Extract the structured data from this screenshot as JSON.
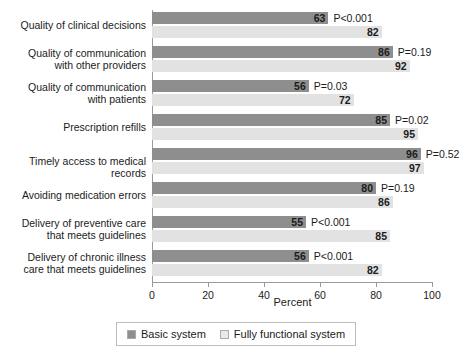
{
  "chart_data": {
    "type": "bar",
    "orientation": "horizontal",
    "title": "",
    "xlabel": "Percent",
    "ylabel": "",
    "xlim": [
      0,
      100
    ],
    "xticks": [
      0,
      20,
      40,
      60,
      80,
      100
    ],
    "grid": false,
    "legend_position": "bottom-center",
    "categories": [
      "Quality of clinical decisions",
      "Quality of communication\nwith other providers",
      "Quality of communication\nwith patients",
      "Prescription refills",
      "Timely access to medical records",
      "Avoiding medication errors",
      "Delivery of preventive care\nthat meets guidelines",
      "Delivery of chronic illness\ncare that meets guidelines"
    ],
    "series": [
      {
        "name": "Basic system",
        "color": "#8e8e8e",
        "values": [
          63,
          86,
          56,
          85,
          96,
          80,
          55,
          56
        ]
      },
      {
        "name": "Fully functional system",
        "color": "#e2e2e2",
        "values": [
          82,
          92,
          72,
          95,
          97,
          86,
          85,
          82
        ]
      }
    ],
    "annotations": {
      "label": "p-value",
      "values": [
        "P<0.001",
        "P=0.19",
        "P=0.03",
        "P=0.02",
        "P=0.52",
        "P=0.19",
        "P<0.001",
        "P<0.001"
      ]
    }
  },
  "axis": {
    "xlabel": "Percent",
    "ticklabels": [
      "0",
      "20",
      "40",
      "60",
      "80",
      "100"
    ]
  },
  "legend": {
    "items": [
      {
        "label": "Basic system",
        "swatch": "dark"
      },
      {
        "label": "Fully functional system",
        "swatch": "light"
      }
    ]
  },
  "watermark": {
    "text": ""
  }
}
